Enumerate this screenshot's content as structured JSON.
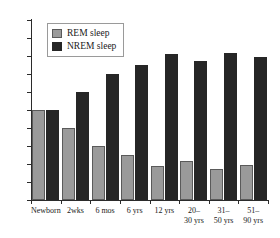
{
  "chart_data": {
    "type": "bar",
    "title": "",
    "subtitle": "",
    "xlabel": "",
    "ylabel": "",
    "ylim": [
      0,
      100
    ],
    "yticks": [
      0,
      10,
      20,
      30,
      40,
      50,
      60,
      70,
      80,
      90,
      100
    ],
    "grid": false,
    "legend_position": "top-left",
    "categories": [
      "Newborn",
      "2wks",
      "6 mos",
      "6 yrs",
      "12 yrs",
      "20–\n30 yrs",
      "31–\n50 yrs",
      "51–\n90 yrs"
    ],
    "series": [
      {
        "name": "REM sleep",
        "color": "#9a9a9a",
        "values": [
          50,
          40,
          30,
          25,
          19,
          21.5,
          17.5,
          19.5
        ]
      },
      {
        "name": "NREM sleep",
        "color": "#262626",
        "values": [
          50,
          60,
          70,
          75,
          81,
          77.5,
          81.5,
          79.5
        ]
      }
    ]
  },
  "legend": {
    "items": [
      {
        "label": "REM sleep",
        "swatch": "rem"
      },
      {
        "label": "NREM sleep",
        "swatch": "nrem"
      }
    ]
  }
}
